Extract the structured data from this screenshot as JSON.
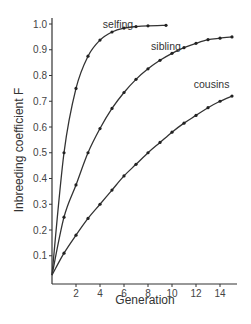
{
  "chart_data": {
    "type": "line",
    "title": "",
    "xlabel": "Generation",
    "ylabel": "Inbreeding coefficient F",
    "xlim": [
      0,
      15.5
    ],
    "ylim": [
      0,
      1.0
    ],
    "x_ticks": [
      2,
      4,
      6,
      8,
      10,
      12,
      14
    ],
    "y_ticks": [
      0.1,
      0.2,
      0.3,
      0.4,
      0.5,
      0.6,
      0.7,
      0.8,
      0.9,
      1.0
    ],
    "y_tick_labels": [
      "0.1",
      "0.2",
      "0.3",
      "0.4",
      "0.5",
      "0.6",
      "0.7",
      "0.8",
      "0.9",
      "1.0"
    ],
    "grid": false,
    "legend": "inline labels",
    "series": [
      {
        "name": "selfing",
        "label_pos": [
          5.5,
          0.985
        ],
        "x": [
          0,
          1,
          2,
          3,
          4,
          5,
          6,
          7,
          8,
          9.5
        ],
        "values": [
          0.025,
          0.5,
          0.75,
          0.875,
          0.9375,
          0.969,
          0.984,
          0.99,
          0.993,
          0.995
        ]
      },
      {
        "name": "sibling",
        "label_pos": [
          9.5,
          0.9
        ],
        "x": [
          0,
          1,
          2,
          3,
          4,
          5,
          6,
          7,
          8,
          9,
          10,
          11,
          12,
          13,
          14,
          15
        ],
        "values": [
          0.025,
          0.25,
          0.375,
          0.5,
          0.594,
          0.672,
          0.734,
          0.785,
          0.826,
          0.859,
          0.886,
          0.908,
          0.925,
          0.939,
          0.945,
          0.95
        ]
      },
      {
        "name": "cousins",
        "label_pos": [
          13.3,
          0.75
        ],
        "x": [
          0,
          1,
          2,
          3,
          4,
          5,
          6,
          7,
          8,
          9,
          10,
          11,
          12,
          13,
          14,
          15
        ],
        "values": [
          0.025,
          0.11,
          0.18,
          0.245,
          0.3,
          0.355,
          0.41,
          0.455,
          0.5,
          0.54,
          0.58,
          0.615,
          0.645,
          0.675,
          0.7,
          0.72
        ]
      }
    ]
  },
  "labels": {
    "xlabel": "Generation",
    "ylabel": "Inbreeding coefficient F",
    "series": [
      "selfing",
      "sibling",
      "cousins"
    ]
  }
}
